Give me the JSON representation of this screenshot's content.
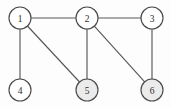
{
  "figure": {
    "width": 171,
    "height": 108,
    "background_color": "#fdfdfd"
  },
  "style": {
    "node_radius": 11,
    "node_fill": "#ffffff",
    "node_shaded_fill": "#ebebeb",
    "node_stroke": "#4a4a4a",
    "edge_stroke": "#585858",
    "edge_width": 1.15,
    "label_color": "#2b2b2b"
  },
  "chart_data": {
    "type": "diagram",
    "diagram_kind": "undirected-graph",
    "title": "",
    "xlabel": "",
    "ylabel": "",
    "node_count": 6,
    "edge_count": 7,
    "nodes": [
      {
        "id": "1",
        "label": "1",
        "cx": 20,
        "cy": 18,
        "r": 11,
        "shaded": false
      },
      {
        "id": "2",
        "label": "2",
        "cx": 87,
        "cy": 18,
        "r": 11,
        "shaded": false
      },
      {
        "id": "3",
        "label": "3",
        "cx": 152,
        "cy": 18,
        "r": 11,
        "shaded": false
      },
      {
        "id": "4",
        "label": "4",
        "cx": 20,
        "cy": 90,
        "r": 11,
        "shaded": false
      },
      {
        "id": "5",
        "label": "5",
        "cx": 87,
        "cy": 90,
        "r": 11,
        "shaded": true
      },
      {
        "id": "6",
        "label": "6",
        "cx": 152,
        "cy": 90,
        "r": 11,
        "shaded": true
      }
    ],
    "edges": [
      {
        "from": "1",
        "to": "2",
        "name": "edge-1-2"
      },
      {
        "from": "2",
        "to": "3",
        "name": "edge-2-3"
      },
      {
        "from": "1",
        "to": "4",
        "name": "edge-1-4"
      },
      {
        "from": "1",
        "to": "5",
        "name": "edge-1-5"
      },
      {
        "from": "2",
        "to": "5",
        "name": "edge-2-5"
      },
      {
        "from": "2",
        "to": "6",
        "name": "edge-2-6"
      },
      {
        "from": "3",
        "to": "6",
        "name": "edge-3-6"
      }
    ],
    "adjacency": {
      "1": [
        "2",
        "4",
        "5"
      ],
      "2": [
        "1",
        "3",
        "5",
        "6"
      ],
      "3": [
        "2",
        "6"
      ],
      "4": [
        "1"
      ],
      "5": [
        "1",
        "2"
      ],
      "6": [
        "2",
        "3"
      ]
    }
  }
}
